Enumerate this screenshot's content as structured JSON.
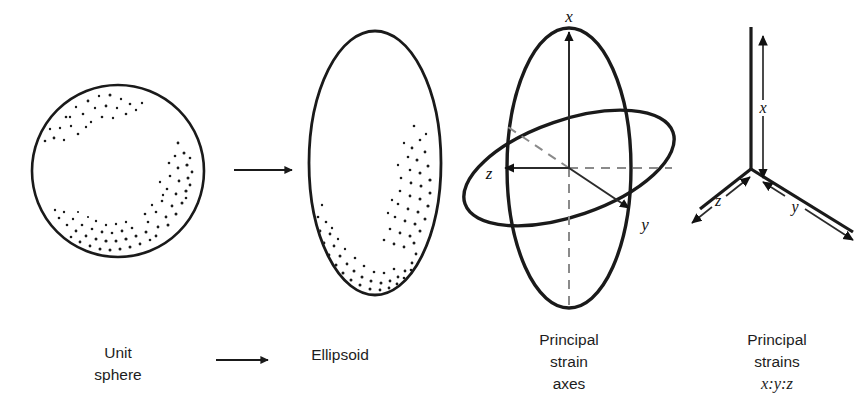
{
  "figure": {
    "title_visible": false,
    "background_color": "#ffffff",
    "ink_color": "#1a1a1a",
    "panels": [
      {
        "id": "unit-sphere",
        "shape": "circle",
        "caption_lines": [
          "Unit",
          "sphere"
        ],
        "center": [
          118,
          171
        ],
        "radius": 86,
        "stipple": true
      },
      {
        "id": "ellipsoid",
        "shape": "ellipse",
        "caption_lines": [
          "Ellipsoid"
        ],
        "center": [
          375,
          163
        ],
        "rx": 66,
        "ry": 132,
        "stipple": true
      },
      {
        "id": "principal-strain-axes",
        "shape": "two-ellipses-with-axes",
        "caption_lines": [
          "Principal",
          "strain",
          "axes"
        ],
        "axis_labels": [
          "x",
          "y",
          "z"
        ]
      },
      {
        "id": "principal-strains",
        "shape": "axis-triad",
        "caption_lines": [
          "Principal",
          "strains",
          "x:y:z"
        ],
        "axis_labels": [
          "x",
          "y",
          "z"
        ]
      }
    ],
    "arrows": [
      {
        "id": "transform-arrow-main",
        "from": [
          235,
          170
        ],
        "to": [
          295,
          170
        ],
        "style": "solid"
      },
      {
        "id": "transform-arrow-caption",
        "from": [
          218,
          360
        ],
        "to": [
          272,
          360
        ],
        "style": "solid"
      }
    ],
    "captions": {
      "unit_sphere_line1": "Unit",
      "unit_sphere_line2": "sphere",
      "ellipsoid_line1": "Ellipsoid",
      "principal_axes_line1": "Principal",
      "principal_axes_line2": "strain",
      "principal_axes_line3": "axes",
      "principal_strains_line1": "Principal",
      "principal_strains_line2": "strains",
      "principal_strains_line3": "x:y:z"
    },
    "labels": {
      "axes_x": "x",
      "axes_y": "y",
      "axes_z": "z",
      "triad_x": "x",
      "triad_y": "y",
      "triad_z": "z"
    }
  }
}
